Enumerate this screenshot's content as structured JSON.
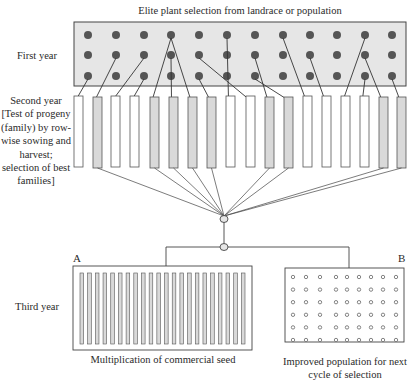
{
  "title": "Elite plant selection from landrace or population",
  "stages": {
    "first_year": "First year",
    "second_year": "Second year [Test of progeny (family) by row-wise sowing and harvest; selection of best families]",
    "third_year": "Third year"
  },
  "outcomes": {
    "a": {
      "letter": "A",
      "caption": "Multiplication of commercial seed",
      "strip_count": 22
    },
    "b": {
      "letter": "B",
      "caption": "Improved population for next cycle of selection",
      "grid_rows": 6,
      "grid_cols": 9
    }
  },
  "first_year_field": {
    "rows": 3,
    "cols": 12
  },
  "progeny_rows": [
    {
      "id": 1,
      "selected": false
    },
    {
      "id": 2,
      "selected": true
    },
    {
      "id": 3,
      "selected": false
    },
    {
      "id": 4,
      "selected": false
    },
    {
      "id": 5,
      "selected": true
    },
    {
      "id": 6,
      "selected": true
    },
    {
      "id": 7,
      "selected": true
    },
    {
      "id": 8,
      "selected": true
    },
    {
      "id": 9,
      "selected": false
    },
    {
      "id": 10,
      "selected": false
    },
    {
      "id": 11,
      "selected": true
    },
    {
      "id": 12,
      "selected": true
    },
    {
      "id": 13,
      "selected": false
    },
    {
      "id": 14,
      "selected": false
    },
    {
      "id": 15,
      "selected": false
    },
    {
      "id": 16,
      "selected": false
    },
    {
      "id": 17,
      "selected": true
    },
    {
      "id": 18,
      "selected": true
    }
  ],
  "colors": {
    "field_fill": "#e6e6e6",
    "dot": "#555555",
    "selected_fill": "#d9d9d9",
    "line": "#333333"
  }
}
